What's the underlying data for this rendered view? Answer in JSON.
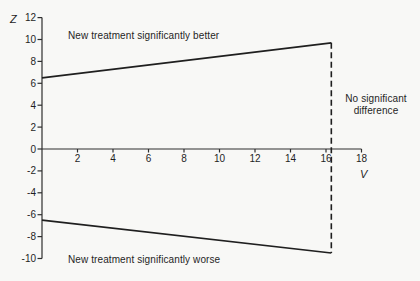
{
  "chart_data": {
    "type": "line",
    "xlabel": "V",
    "ylabel": "Z",
    "xlim": [
      0,
      18
    ],
    "ylim": [
      -10,
      12
    ],
    "grid": false,
    "legend": "none",
    "x_ticks": [
      2,
      4,
      6,
      8,
      10,
      12,
      14,
      16,
      18
    ],
    "y_ticks": [
      12,
      10,
      8,
      6,
      4,
      2,
      0,
      -2,
      -4,
      -6,
      -8,
      -10
    ],
    "series": [
      {
        "name": "upper-boundary",
        "style": "solid",
        "points": [
          [
            0,
            6.5
          ],
          [
            16.3,
            9.7
          ]
        ]
      },
      {
        "name": "lower-boundary",
        "style": "solid",
        "points": [
          [
            0,
            -6.5
          ],
          [
            16.3,
            -9.5
          ]
        ]
      },
      {
        "name": "stopping-boundary-vertical",
        "style": "dashed",
        "points": [
          [
            16.3,
            9.7
          ],
          [
            16.3,
            -9.5
          ]
        ]
      }
    ],
    "annotations": [
      {
        "id": "upper-region",
        "text": "New treatment significantly better"
      },
      {
        "id": "lower-region",
        "text": "New treatment significantly worse"
      },
      {
        "id": "right-region",
        "text": "No significant difference"
      }
    ]
  },
  "colors": {
    "background": "#f8f8f6",
    "line": "#1f1f1f",
    "axis": "#2e2e2e",
    "text": "#1f1f1f"
  }
}
